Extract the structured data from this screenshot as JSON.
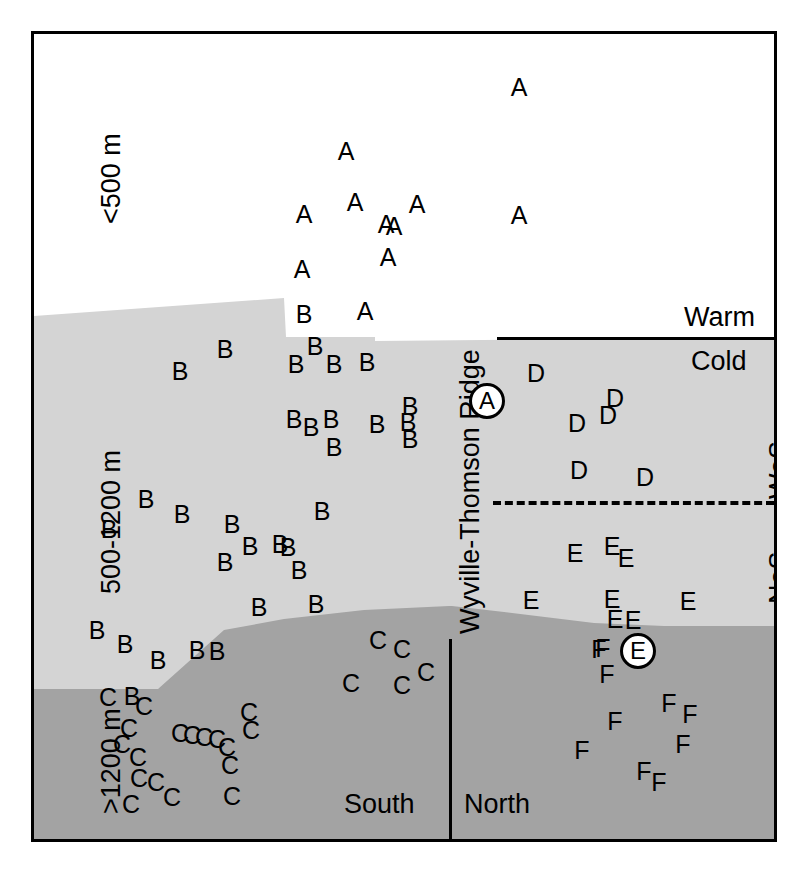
{
  "figure": {
    "type": "schematic-cross-section",
    "colors": {
      "shallow": "#ffffff",
      "mid": "#d4d4d4",
      "deep": "#a3a3a3",
      "line": "#000000"
    }
  },
  "depth_labels": {
    "shallow": "<500 m",
    "mid": "500-1200 m",
    "deep": ">1200 m"
  },
  "side_labels": {
    "south": "South",
    "north": "North",
    "ridge": "Wyville-Thomson Ridge",
    "warm": "Warm",
    "cold": "Cold",
    "wos": "WoS",
    "nos": "NoS"
  },
  "circled_markers": [
    {
      "label": "A",
      "x": 453,
      "y": 367
    },
    {
      "label": "E",
      "x": 604,
      "y": 617
    }
  ],
  "chart_data": {
    "type": "scatter",
    "title": "",
    "xlabel": "",
    "ylabel": "Depth",
    "groups": [
      {
        "name": "A",
        "zone": "shallow",
        "region": "south",
        "count": 11,
        "points": [
          [
            485,
            53
          ],
          [
            312,
            117
          ],
          [
            321,
            168
          ],
          [
            383,
            170
          ],
          [
            270,
            180
          ],
          [
            352,
            190
          ],
          [
            360,
            192
          ],
          [
            354,
            223
          ],
          [
            268,
            235
          ],
          [
            331,
            277
          ],
          [
            485,
            181
          ]
        ]
      },
      {
        "name": "B",
        "zone": "mid",
        "region": "south",
        "count": 33,
        "points": [
          [
            270,
            280
          ],
          [
            281,
            312
          ],
          [
            262,
            330
          ],
          [
            300,
            330
          ],
          [
            191,
            315
          ],
          [
            333,
            328
          ],
          [
            146,
            337
          ],
          [
            260,
            385
          ],
          [
            277,
            393
          ],
          [
            297,
            385
          ],
          [
            300,
            413
          ],
          [
            343,
            390
          ],
          [
            374,
            388
          ],
          [
            376,
            372
          ],
          [
            376,
            405
          ],
          [
            112,
            465
          ],
          [
            148,
            480
          ],
          [
            75,
            495
          ],
          [
            198,
            490
          ],
          [
            216,
            512
          ],
          [
            246,
            510
          ],
          [
            254,
            513
          ],
          [
            191,
            528
          ],
          [
            265,
            536
          ],
          [
            282,
            570
          ],
          [
            63,
            596
          ],
          [
            91,
            610
          ],
          [
            124,
            626
          ],
          [
            163,
            616
          ],
          [
            183,
            617
          ],
          [
            98,
            662
          ],
          [
            225,
            573
          ],
          [
            288,
            477
          ]
        ]
      },
      {
        "name": "C",
        "zone": "deep",
        "region": "south",
        "count": 25,
        "points": [
          [
            344,
            606
          ],
          [
            368,
            615
          ],
          [
            317,
            649
          ],
          [
            368,
            651
          ],
          [
            392,
            638
          ],
          [
            74,
            663
          ],
          [
            110,
            672
          ],
          [
            95,
            694
          ],
          [
            88,
            710
          ],
          [
            104,
            723
          ],
          [
            105,
            744
          ],
          [
            122,
            748
          ],
          [
            138,
            763
          ],
          [
            146,
            699
          ],
          [
            158,
            701
          ],
          [
            170,
            703
          ],
          [
            183,
            705
          ],
          [
            193,
            713
          ],
          [
            215,
            678
          ],
          [
            217,
            696
          ],
          [
            196,
            731
          ],
          [
            97,
            770
          ],
          [
            198,
            762
          ]
        ]
      },
      {
        "name": "D",
        "zone": "mid",
        "region": "north",
        "count": 6,
        "points": [
          [
            502,
            339
          ],
          [
            543,
            389
          ],
          [
            574,
            381
          ],
          [
            581,
            364
          ],
          [
            545,
            436
          ],
          [
            611,
            443
          ]
        ]
      },
      {
        "name": "E",
        "zone": "mid",
        "region": "north",
        "count": 8,
        "points": [
          [
            541,
            519
          ],
          [
            578,
            512
          ],
          [
            592,
            524
          ],
          [
            497,
            566
          ],
          [
            578,
            565
          ],
          [
            581,
            585
          ],
          [
            599,
            586
          ],
          [
            654,
            567
          ]
        ]
      },
      {
        "name": "F",
        "zone": "deep",
        "region": "north",
        "count": 9,
        "points": [
          [
            569,
            614
          ],
          [
            573,
            640
          ],
          [
            565,
            615
          ],
          [
            635,
            669
          ],
          [
            581,
            687
          ],
          [
            649,
            710
          ],
          [
            548,
            716
          ],
          [
            610,
            737
          ],
          [
            625,
            748
          ],
          [
            656,
            680
          ]
        ]
      }
    ]
  },
  "terrain": {
    "mid_top": "Light-gray 500-1200 m layer, top boundary slopes up from left edge to a peak then steps down north of the ridge",
    "deep_top": "Dark-gray >1200 m layer top boundary rises left-to-right under the south, dips slightly north"
  }
}
